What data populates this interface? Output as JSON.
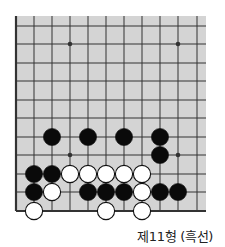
{
  "diagram": {
    "caption": "제11형 (흑선)",
    "colors": {
      "board": "#d4d4d4",
      "line": "#333333",
      "black_stone": "#0a0a0a",
      "white_stone": "#ffffff"
    },
    "grid": {
      "cols_x": [
        16,
        34,
        52,
        70,
        88,
        106,
        124,
        142,
        160,
        178,
        197
      ],
      "rows_y": [
        26,
        44,
        63,
        81,
        100,
        118,
        137,
        155,
        174,
        192,
        211
      ],
      "board_rect": {
        "x": 16,
        "y": 16,
        "w": 190,
        "h": 195
      },
      "edges": [
        "left",
        "bottom"
      ]
    },
    "star_points": [
      {
        "col": 3,
        "row": 1
      },
      {
        "col": 9,
        "row": 1
      },
      {
        "col": 3,
        "row": 7
      },
      {
        "col": 9,
        "row": 7
      }
    ],
    "stones": [
      {
        "color": "black",
        "col": 2,
        "row": 6
      },
      {
        "color": "black",
        "col": 4,
        "row": 6
      },
      {
        "color": "black",
        "col": 6,
        "row": 6
      },
      {
        "color": "black",
        "col": 8,
        "row": 6
      },
      {
        "color": "black",
        "col": 8,
        "row": 7
      },
      {
        "color": "black",
        "col": 1,
        "row": 8
      },
      {
        "color": "black",
        "col": 2,
        "row": 8
      },
      {
        "color": "white",
        "col": 3,
        "row": 8
      },
      {
        "color": "white",
        "col": 4,
        "row": 8
      },
      {
        "color": "white",
        "col": 5,
        "row": 8
      },
      {
        "color": "white",
        "col": 6,
        "row": 8
      },
      {
        "color": "white",
        "col": 7,
        "row": 8
      },
      {
        "color": "black",
        "col": 1,
        "row": 9
      },
      {
        "color": "white",
        "col": 2,
        "row": 9
      },
      {
        "color": "black",
        "col": 4,
        "row": 9
      },
      {
        "color": "black",
        "col": 5,
        "row": 9
      },
      {
        "color": "black",
        "col": 6,
        "row": 9
      },
      {
        "color": "white",
        "col": 7,
        "row": 9
      },
      {
        "color": "black",
        "col": 8,
        "row": 9
      },
      {
        "color": "black",
        "col": 9,
        "row": 9
      },
      {
        "color": "white",
        "col": 1,
        "row": 10
      },
      {
        "color": "white",
        "col": 5,
        "row": 10
      },
      {
        "color": "white",
        "col": 7,
        "row": 10
      }
    ]
  }
}
